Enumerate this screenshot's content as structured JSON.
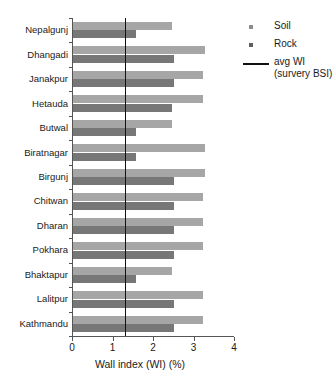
{
  "chart_data": {
    "type": "bar",
    "orientation": "horizontal",
    "title": "",
    "xlabel": "Wall index (WI) (%)",
    "ylabel": "",
    "xlim": [
      0,
      4
    ],
    "xticks": [
      0,
      1,
      2,
      3,
      4
    ],
    "xticklabels": [
      "0",
      "1",
      "2",
      "3",
      "4"
    ],
    "grid": false,
    "legend_position": "right",
    "categories": [
      "Nepalgunj",
      "Dhangadi",
      "Janakpur",
      "Hetauda",
      "Butwal",
      "Biratnagar",
      "Birgunj",
      "Chitwan",
      "Dharan",
      "Pokhara",
      "Bhaktapur",
      "Lalitpur",
      "Kathmandu"
    ],
    "series": [
      {
        "name": "Soil",
        "color": "#a6a6a6",
        "values": [
          2.45,
          3.25,
          3.2,
          3.2,
          2.45,
          3.25,
          3.25,
          3.2,
          3.2,
          3.2,
          2.45,
          3.2,
          3.2
        ]
      },
      {
        "name": "Rock",
        "color": "#777777",
        "values": [
          1.55,
          2.5,
          2.5,
          2.45,
          1.55,
          1.55,
          2.5,
          2.5,
          2.5,
          2.5,
          1.55,
          2.5,
          2.5
        ]
      }
    ],
    "reference_line": {
      "label": "avg WI",
      "label_line2": "(survery BSI)",
      "value": 1.3,
      "color": "#111111"
    }
  },
  "legend": {
    "items": [
      {
        "label": "Soil",
        "marker": "square-swatch"
      },
      {
        "label": "Rock",
        "marker": "square-swatch"
      },
      {
        "label": "avg WI",
        "label2": "(survery BSI)",
        "marker": "line-swatch"
      }
    ]
  }
}
